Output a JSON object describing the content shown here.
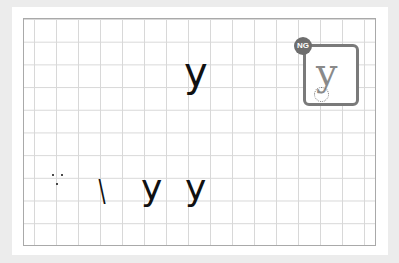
{
  "practice_sheet": {
    "top_glyph": "y",
    "bottom_row": {
      "colon_marks": ":",
      "stroke_slash": "\\",
      "glyph_1": "y",
      "glyph_2": "y"
    }
  },
  "ng_example": {
    "badge_label": "NG",
    "glyph": "y",
    "badge_color": "#6e6e6e",
    "frame_color": "#7a7a7a"
  },
  "grid": {
    "line_color": "#d8d8d8",
    "border_color": "#a9a9a9"
  }
}
